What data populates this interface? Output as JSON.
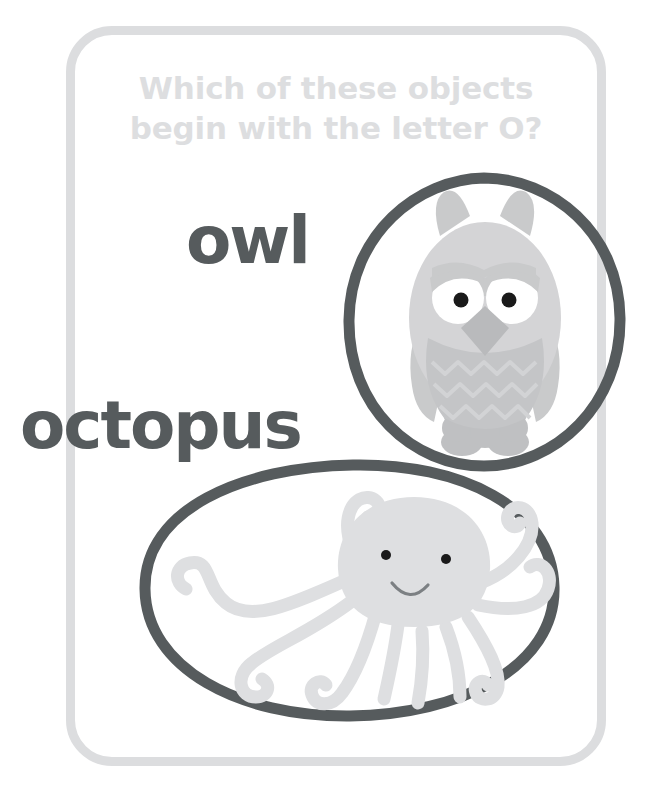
{
  "worksheet": {
    "title": "Which of these objects\nbegin with the letter O?",
    "title_line1": "Which of these objects",
    "title_line2": "begin with the letter O?",
    "border_label": "worksheet-card-border"
  },
  "items": [
    {
      "word": "owl",
      "icon": "owl-illustration",
      "circle_shape": "hand-drawn-circle",
      "circled": true
    },
    {
      "word": "octopus",
      "icon": "octopus-illustration",
      "circle_shape": "hand-drawn-ellipse",
      "circled": true
    }
  ],
  "colors": {
    "title_gray": "#dddee0",
    "word_dark": "#565b5d",
    "circle_dark": "#565b5d",
    "border_gray": "#dcdddf",
    "owl_body": "#d4d4d6",
    "owl_shade": "#bfc0c2",
    "owl_eye_white": "#ffffff",
    "owl_pupil": "#1a1a1a",
    "octopus_body": "#dedfe1",
    "octopus_eye": "#1a1a1a",
    "background": "#ffffff"
  }
}
